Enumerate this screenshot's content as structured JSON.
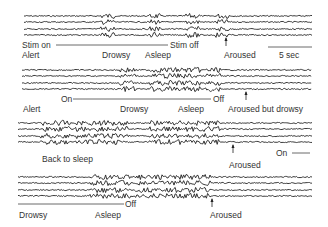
{
  "figure": {
    "panels": [
      {
        "id": "panel-1",
        "stim_on_label": "Stim on",
        "stim_off_label": "Stim off",
        "states": [
          "Alert",
          "Drowsy",
          "Asleep",
          "Aroused"
        ],
        "scale_bar_label": "5 sec"
      },
      {
        "id": "panel-2",
        "stim_on_label": "On",
        "stim_off_label": "Off",
        "states": [
          "Alert",
          "Drowsy",
          "Asleep",
          "Aroused but drowsy"
        ]
      },
      {
        "id": "panel-3",
        "stim_on_label": "On",
        "states": [
          "Back to sleep",
          "Aroused"
        ]
      },
      {
        "id": "panel-4",
        "stim_off_label": "Off",
        "states": [
          "Drowsy",
          "Asleep",
          "Aroused"
        ]
      }
    ],
    "trace_color": "#222222",
    "traces_per_panel": 4
  }
}
